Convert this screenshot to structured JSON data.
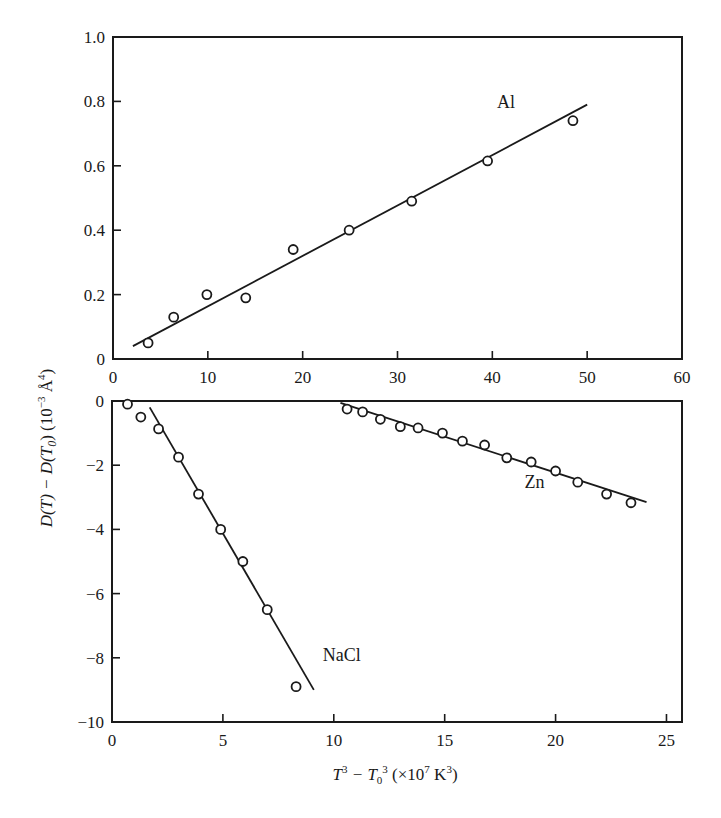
{
  "chart_data": [
    {
      "type": "scatter",
      "panel": "top",
      "title": "",
      "xlabel": "",
      "ylabel": "D(T) − D(T₀)  (10⁻³ Å⁴)",
      "xlim": [
        0,
        60
      ],
      "ylim": [
        0,
        1.0
      ],
      "x_ticks": [
        "0",
        "10",
        "20",
        "30",
        "40",
        "50",
        "60"
      ],
      "y_ticks": [
        "0",
        "0.2",
        "0.4",
        "0.6",
        "0.8",
        "1.0"
      ],
      "grid": false,
      "series": [
        {
          "name": "Al",
          "marker": "open-circle",
          "points": [
            [
              3.7,
              0.05
            ],
            [
              6.4,
              0.13
            ],
            [
              9.9,
              0.2
            ],
            [
              14.0,
              0.19
            ],
            [
              19.0,
              0.34
            ],
            [
              24.9,
              0.4
            ],
            [
              31.5,
              0.49
            ],
            [
              39.5,
              0.615
            ],
            [
              48.5,
              0.74
            ]
          ],
          "fit_line": [
            [
              2.1,
              0.04
            ],
            [
              50.0,
              0.79
            ]
          ],
          "label_pos": [
            40.5,
            0.78
          ]
        }
      ]
    },
    {
      "type": "scatter",
      "panel": "bottom",
      "title": "",
      "xlabel": "T³ − T₀³   (×10⁷ K³)",
      "ylabel": "D(T) − D(T₀)  (10⁻³ Å⁴)",
      "xlim": [
        0,
        25.7
      ],
      "ylim": [
        -10,
        0
      ],
      "x_ticks": [
        "0",
        "5",
        "10",
        "15",
        "20",
        "25"
      ],
      "y_ticks": [
        "0",
        "−2",
        "−4",
        "−6",
        "−8",
        "−10"
      ],
      "grid": false,
      "series": [
        {
          "name": "NaCl",
          "marker": "open-circle",
          "points": [
            [
              0.7,
              -0.1
            ],
            [
              1.3,
              -0.5
            ],
            [
              2.1,
              -0.87
            ],
            [
              3.0,
              -1.75
            ],
            [
              3.9,
              -2.9
            ],
            [
              4.9,
              -4.0
            ],
            [
              5.9,
              -5.0
            ],
            [
              7.0,
              -6.5
            ],
            [
              8.3,
              -8.9
            ]
          ],
          "fit_line": [
            [
              1.7,
              -0.2
            ],
            [
              9.1,
              -9.0
            ]
          ],
          "label_pos": [
            9.5,
            -8.1
          ]
        },
        {
          "name": "Zn",
          "marker": "open-circle",
          "points": [
            [
              10.6,
              -0.25
            ],
            [
              11.3,
              -0.34
            ],
            [
              12.1,
              -0.57
            ],
            [
              13.0,
              -0.8
            ],
            [
              13.8,
              -0.84
            ],
            [
              14.9,
              -1.0
            ],
            [
              15.8,
              -1.25
            ],
            [
              16.8,
              -1.37
            ],
            [
              17.8,
              -1.77
            ],
            [
              18.9,
              -1.9
            ],
            [
              20.0,
              -2.18
            ],
            [
              21.0,
              -2.53
            ],
            [
              22.3,
              -2.9
            ],
            [
              23.4,
              -3.17
            ]
          ],
          "fit_line": [
            [
              10.3,
              -0.06
            ],
            [
              24.1,
              -3.15
            ]
          ],
          "label_pos": [
            18.6,
            -2.7
          ]
        }
      ]
    }
  ],
  "labels": {
    "y_axis_title_main": "D(T) − D(T",
    "y_axis_title_sub": "0",
    "y_axis_title_end": ")   (10",
    "y_axis_exp": "−3",
    "y_axis_unit": " Å",
    "y_axis_unit_exp": "4",
    "y_axis_close": ")",
    "x_axis_T": "T",
    "x_axis_exp3": "3",
    "x_axis_minus": " − T",
    "x_axis_sub0": "0",
    "x_axis_exp3b": "3",
    "x_axis_unit_open": "   (×10",
    "x_axis_unit_exp7": "7",
    "x_axis_unit_K": " K",
    "x_axis_unit_exp3": "3",
    "x_axis_unit_close": ")"
  },
  "colors": {
    "ink": "#1a1a1a",
    "background": "#ffffff"
  }
}
